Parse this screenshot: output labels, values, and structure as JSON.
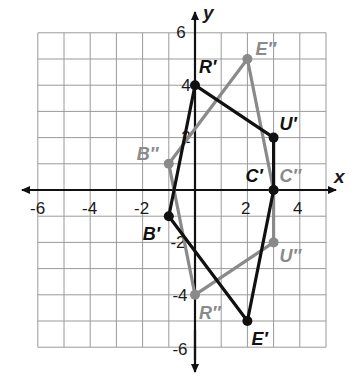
{
  "diagram": {
    "type": "coordinate-plane",
    "axes": {
      "x_label": "x",
      "y_label": "y",
      "x_range": [
        -6,
        5
      ],
      "y_range": [
        -6,
        6
      ],
      "x_ticks": [
        "-6",
        "-4",
        "-2",
        "2",
        "4"
      ],
      "y_ticks": [
        "6",
        "4",
        "2",
        "-2",
        "-4",
        "-6"
      ],
      "grid": true
    },
    "figures": [
      {
        "name": "prime-pentagon",
        "color": "#111111",
        "vertices": [
          {
            "label": "B′",
            "x": -1,
            "y": -1
          },
          {
            "label": "R′",
            "x": 0,
            "y": 4
          },
          {
            "label": "U′",
            "x": 3,
            "y": 2
          },
          {
            "label": "C′",
            "x": 3,
            "y": 0
          },
          {
            "label": "E′",
            "x": 2,
            "y": -5
          }
        ]
      },
      {
        "name": "double-prime-pentagon",
        "color": "#8a8a8a",
        "vertices": [
          {
            "label": "B″",
            "x": -1,
            "y": 1
          },
          {
            "label": "E″",
            "x": 2,
            "y": 5
          },
          {
            "label": "C″",
            "x": 3,
            "y": 0
          },
          {
            "label": "U″",
            "x": 3,
            "y": -2
          },
          {
            "label": "R″",
            "x": 0,
            "y": -4
          }
        ]
      }
    ]
  }
}
